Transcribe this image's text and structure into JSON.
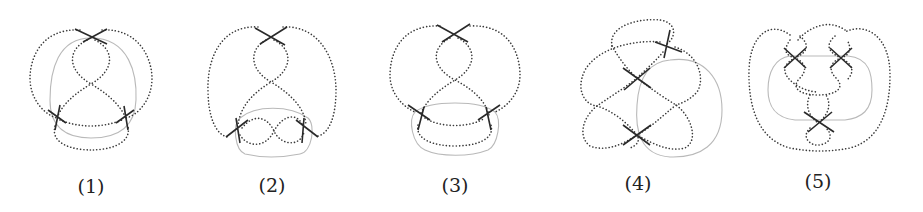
{
  "figure": {
    "panels": [
      {
        "id": 1,
        "label": "(1)",
        "label_pos": [
          91,
          186
        ]
      },
      {
        "id": 2,
        "label": "(2)",
        "label_pos": [
          272,
          185
        ]
      },
      {
        "id": 3,
        "label": "(3)",
        "label_pos": [
          455,
          185
        ]
      },
      {
        "id": 4,
        "label": "(4)",
        "label_pos": [
          638,
          183
        ]
      },
      {
        "id": 5,
        "label": "(5)",
        "label_pos": [
          818,
          181
        ]
      }
    ],
    "styles": {
      "dotted_strand_color": "#3a3a3a",
      "crossing_color": "#2a2a2a",
      "gray_loop_color": "#b9b9b9",
      "background": "#ffffff"
    }
  }
}
